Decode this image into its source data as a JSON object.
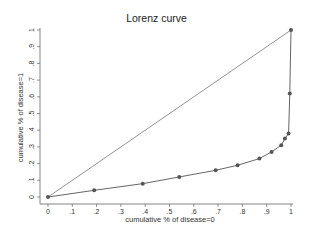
{
  "chart_data": {
    "type": "line",
    "title": "Lorenz curve",
    "xlabel": "cumulative % of disease=0",
    "ylabel": "cumulative % of disease=1",
    "xlim": [
      0,
      1
    ],
    "ylim": [
      0,
      1
    ],
    "grid": false,
    "legend": null,
    "x_ticks": [
      "0",
      ".1",
      ".2",
      ".3",
      ".4",
      ".5",
      ".6",
      ".7",
      ".8",
      ".9",
      "1"
    ],
    "y_ticks": [
      "0",
      ".1",
      ".2",
      ".3",
      ".4",
      ".5",
      ".6",
      ".7",
      ".8",
      ".9",
      "1"
    ],
    "series": [
      {
        "name": "Lorenz curve",
        "marker": "circle",
        "x": [
          0,
          0.19,
          0.39,
          0.54,
          0.69,
          0.78,
          0.87,
          0.92,
          0.96,
          0.975,
          0.99,
          0.995,
          1
        ],
        "y": [
          0,
          0.04,
          0.08,
          0.12,
          0.16,
          0.19,
          0.23,
          0.27,
          0.31,
          0.35,
          0.38,
          0.62,
          1
        ]
      },
      {
        "name": "line of equality",
        "marker": "none",
        "x": [
          0,
          1
        ],
        "y": [
          0,
          1
        ]
      }
    ]
  },
  "colors": {
    "curve": "#555555",
    "equality": "#777777",
    "axis": "#666666",
    "text": "#333333"
  }
}
